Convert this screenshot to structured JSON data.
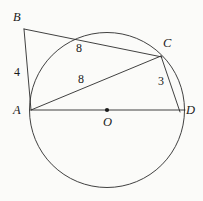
{
  "figure": {
    "canvas": {
      "width": 203,
      "height": 201
    },
    "background_color": "#fbfbf9",
    "stroke_color": "#2b2b2b",
    "text_color": "#1a1a1a"
  },
  "circle": {
    "center_x": 107,
    "center_y": 110,
    "radius": 77.5,
    "center_label": "O",
    "center_label_x": 103,
    "center_label_y": 116
  },
  "points": [
    {
      "id": "B",
      "label": "B",
      "x": 24,
      "y": 29,
      "label_x": 13,
      "label_y": 11,
      "on_circle": false
    },
    {
      "id": "C",
      "label": "C",
      "x": 161,
      "y": 56,
      "label_x": 163,
      "label_y": 37,
      "on_circle": true
    },
    {
      "id": "A",
      "label": "A",
      "x": 31,
      "y": 110,
      "label_x": 13,
      "label_y": 104,
      "on_circle": true
    },
    {
      "id": "D",
      "label": "D",
      "x": 184,
      "y": 110,
      "label_x": 186,
      "label_y": 104,
      "on_circle": true
    }
  ],
  "segments": [
    {
      "id": "BA",
      "from": "B",
      "to": "A",
      "x1": 24,
      "y1": 29,
      "x2": 31,
      "y2": 110
    },
    {
      "id": "BC",
      "from": "B",
      "to": "C",
      "x1": 24,
      "y1": 29,
      "x2": 162,
      "y2": 57
    },
    {
      "id": "AC",
      "from": "A",
      "to": "C",
      "x1": 31,
      "y1": 110,
      "x2": 161,
      "y2": 56
    },
    {
      "id": "AD",
      "from": "A",
      "to": "D",
      "x1": 31,
      "y1": 110,
      "x2": 185,
      "y2": 110
    },
    {
      "id": "CD",
      "from": "C",
      "to": "D",
      "x1": 161,
      "y1": 56,
      "x2": 180,
      "y2": 112
    }
  ],
  "measurements": [
    {
      "id": "len-BA",
      "segment": "BA",
      "value": "4",
      "x": 14,
      "y": 66
    },
    {
      "id": "len-BC",
      "segment": "BC",
      "value": "8",
      "x": 76,
      "y": 42
    },
    {
      "id": "len-AC",
      "segment": "AC",
      "value": "8",
      "x": 78,
      "y": 73
    },
    {
      "id": "len-CD",
      "segment": "CD",
      "value": "3",
      "x": 158,
      "y": 75
    }
  ]
}
